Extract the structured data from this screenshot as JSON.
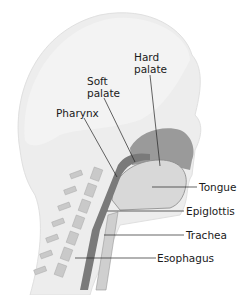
{
  "diagram": {
    "labels": {
      "hard_palate_line1": "Hard",
      "hard_palate_line2": "palate",
      "soft_palate_line1": "Soft",
      "soft_palate_line2": "palate",
      "pharynx": "Pharynx",
      "tongue": "Tongue",
      "epiglottis": "Epiglottis",
      "trachea": "Trachea",
      "esophagus": "Esophagus"
    },
    "colors": {
      "skin": "#ececec",
      "cavity": "#8a8a8a",
      "tongue": "#d4d4d4",
      "vertebra": "#c8c8c8",
      "leader": "#222222"
    }
  }
}
